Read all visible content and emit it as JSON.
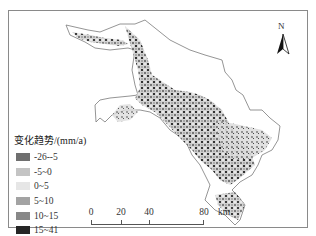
{
  "map": {
    "north_arrow": {
      "label": "N"
    },
    "legend": {
      "title": "变化趋势/(mm/a)",
      "items": [
        {
          "label": "-26--5",
          "color": "#6f6f6f"
        },
        {
          "label": "-5~0",
          "color": "#c4c4c4"
        },
        {
          "label": "0~5",
          "color": "#e6e6e6"
        },
        {
          "label": "5~10",
          "color": "#a3a3a3"
        },
        {
          "label": "10~15",
          "color": "#888888"
        },
        {
          "label": "15~41",
          "color": "#262626"
        }
      ]
    },
    "scale_bar": {
      "ticks": [
        "0",
        "20",
        "40",
        "80"
      ],
      "unit": "km"
    },
    "colors": {
      "frame": "#8a8a8a",
      "boundary": "#7a7a7a",
      "background": "#ffffff"
    }
  }
}
